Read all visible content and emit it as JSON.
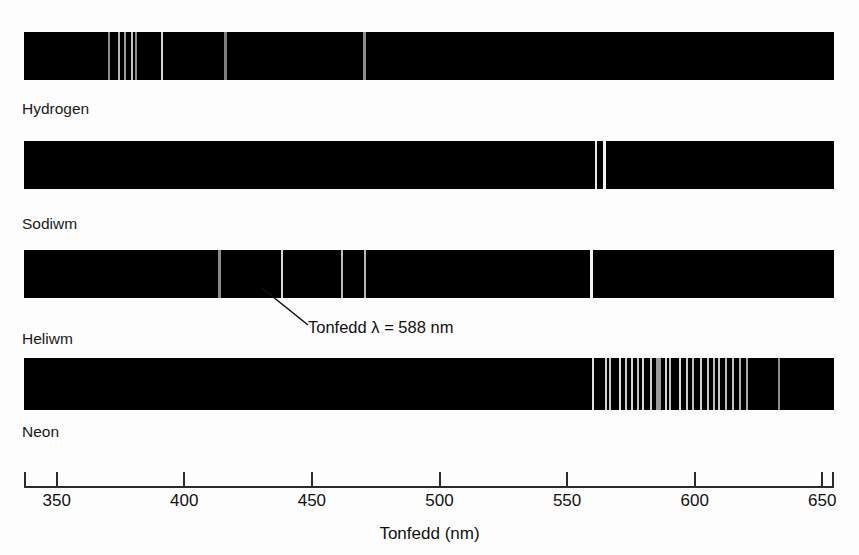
{
  "figure": {
    "background_color": "#fdfdfd",
    "strip_color": "#000000"
  },
  "axis": {
    "title": "Tonfedd (nm)",
    "unit": "nm",
    "min": 337,
    "max": 657,
    "tick_values": [
      350,
      400,
      450,
      500,
      550,
      600,
      650
    ],
    "tick_labels": [
      "350",
      "400",
      "450",
      "500",
      "550",
      "600",
      "650"
    ],
    "px_per_nm": 2.552,
    "origin_px": 56.7
  },
  "annotation": {
    "text": "Tonfedd λ = 588 nm",
    "wavelength": 588,
    "target_spectrum": "Heliwm",
    "leader_from_px": {
      "x": 308,
      "y": 323
    },
    "leader_to_px": {
      "x": 262,
      "y": 288
    }
  },
  "chart_data": {
    "type": "line",
    "xlabel": "Tonfedd (nm)",
    "ylabel": "",
    "xlim": [
      337,
      657
    ],
    "grid": false,
    "legend_position": "below-each-strip",
    "series": [
      {
        "name": "Hydrogen",
        "label": "Hydrogen",
        "lines": [
          {
            "wavelength": 370.6,
            "width_px": 2,
            "color": "#8e8e8e"
          },
          {
            "wavelength": 374.6,
            "width_px": 2,
            "color": "#b4b4b4"
          },
          {
            "wavelength": 376.8,
            "width_px": 2,
            "color": "#9c9c9c"
          },
          {
            "wavelength": 379.4,
            "width_px": 2,
            "color": "#c2c2c2"
          },
          {
            "wavelength": 381.1,
            "width_px": 2,
            "color": "#8a8a8a"
          },
          {
            "wavelength": 391.1,
            "width_px": 2,
            "color": "#d6d6d6"
          },
          {
            "wavelength": 416.0,
            "width_px": 3,
            "color": "#7e7e7e"
          },
          {
            "wavelength": 470.8,
            "width_px": 3,
            "color": "#8d8d8d"
          }
        ]
      },
      {
        "name": "Sodiwm",
        "label": "Sodiwm",
        "lines": [
          {
            "wavelength": 561.2,
            "width_px": 2,
            "color": "#e8e8e8"
          },
          {
            "wavelength": 564.5,
            "width_px": 3,
            "color": "#f2f2f2"
          }
        ]
      },
      {
        "name": "Heliwm",
        "label": "Heliwm",
        "lines": [
          {
            "wavelength": 413.6,
            "width_px": 3,
            "color": "#8a8a8a"
          },
          {
            "wavelength": 438.1,
            "width_px": 2,
            "color": "#d8d8d8"
          },
          {
            "wavelength": 461.9,
            "width_px": 2,
            "color": "#bdbdbd"
          },
          {
            "wavelength": 470.7,
            "width_px": 2,
            "color": "#b6b6b6"
          },
          {
            "wavelength": 559.6,
            "width_px": 3,
            "color": "#f4f4f4"
          }
        ]
      },
      {
        "name": "Neon",
        "label": "Neon",
        "lines": [
          {
            "wavelength": 560.0,
            "width_px": 2,
            "color": "#e2e2e2"
          },
          {
            "wavelength": 565.2,
            "width_px": 2,
            "color": "#d2d2d2"
          },
          {
            "wavelength": 566.8,
            "width_px": 2,
            "color": "#c8c8c8"
          },
          {
            "wavelength": 570.7,
            "width_px": 2,
            "color": "#dedede"
          },
          {
            "wavelength": 573.0,
            "width_px": 2,
            "color": "#cacaca"
          },
          {
            "wavelength": 575.5,
            "width_px": 2,
            "color": "#d4d4d4"
          },
          {
            "wavelength": 577.6,
            "width_px": 2,
            "color": "#c0c0c0"
          },
          {
            "wavelength": 579.8,
            "width_px": 2,
            "color": "#d8d8d8"
          },
          {
            "wavelength": 582.8,
            "width_px": 2,
            "color": "#cfcfcf"
          },
          {
            "wavelength": 585.7,
            "width_px": 5,
            "color": "#9a9a9a"
          },
          {
            "wavelength": 588.7,
            "width_px": 2,
            "color": "#d6d6d6"
          },
          {
            "wavelength": 590.3,
            "width_px": 2,
            "color": "#c4c4c4"
          },
          {
            "wavelength": 594.2,
            "width_px": 2,
            "color": "#dcdcdc"
          },
          {
            "wavelength": 596.8,
            "width_px": 2,
            "color": "#cecece"
          },
          {
            "wavelength": 599.4,
            "width_px": 2,
            "color": "#bcbcbc"
          },
          {
            "wavelength": 602.3,
            "width_px": 2,
            "color": "#d0d0d0"
          },
          {
            "wavelength": 605.3,
            "width_px": 2,
            "color": "#c6c6c6"
          },
          {
            "wavelength": 607.5,
            "width_px": 2,
            "color": "#bebebe"
          },
          {
            "wavelength": 609.6,
            "width_px": 2,
            "color": "#cbcbcb"
          },
          {
            "wavelength": 612.2,
            "width_px": 2,
            "color": "#bababa"
          },
          {
            "wavelength": 615.0,
            "width_px": 2,
            "color": "#c2c2c2"
          },
          {
            "wavelength": 617.9,
            "width_px": 2,
            "color": "#b0b0b0"
          },
          {
            "wavelength": 620.5,
            "width_px": 2,
            "color": "#a8a8a8"
          },
          {
            "wavelength": 633.2,
            "width_px": 2,
            "color": "#8c8c8c"
          }
        ]
      }
    ]
  },
  "strips": [
    {
      "label": "Hydrogen",
      "top_px": 32,
      "height_px": 48,
      "label_top_px": 101
    },
    {
      "label": "Sodiwm",
      "top_px": 141,
      "height_px": 48,
      "label_top_px": 216
    },
    {
      "label": "Heliwm",
      "top_px": 250,
      "height_px": 48,
      "label_top_px": 331
    },
    {
      "label": "Neon",
      "top_px": 358,
      "height_px": 52,
      "label_top_px": 424
    }
  ]
}
